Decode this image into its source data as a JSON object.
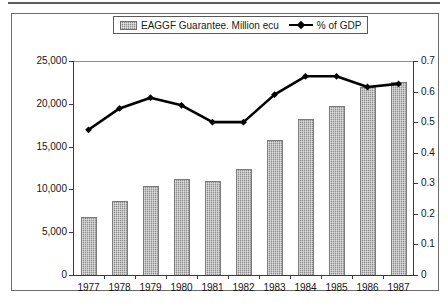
{
  "legend": {
    "entries": [
      {
        "label": "EAGGF Guarantee. Million ecu",
        "marker": "bar-swatch-icon",
        "color": "#8d8d8d"
      },
      {
        "label": "% of GDP",
        "marker": "line-marker-icon",
        "color": "#000000"
      }
    ]
  },
  "chart_data": {
    "type": "bar",
    "title": "",
    "subtitle": "",
    "xlabel": "",
    "ylabel": "",
    "grid": false,
    "legend_position": "top-center",
    "categories": [
      "1977",
      "1978",
      "1979",
      "1980",
      "1981",
      "1982",
      "1983",
      "1984",
      "1985",
      "1986",
      "1987"
    ],
    "series": [
      {
        "name": "EAGGF Guarantee. Million ecu",
        "type": "bar",
        "axis": "left",
        "color": "#8d8d8d",
        "values": [
          6800,
          8600,
          10400,
          11200,
          11000,
          12400,
          15800,
          18200,
          19700,
          22000,
          22500
        ]
      },
      {
        "name": "% of GDP",
        "type": "line",
        "axis": "right",
        "color": "#000000",
        "values": [
          0.475,
          0.545,
          0.58,
          0.555,
          0.5,
          0.5,
          0.59,
          0.65,
          0.65,
          0.615,
          0.625
        ]
      }
    ],
    "yaxis_left": {
      "ylim": [
        0,
        25000
      ],
      "ticks": [
        0,
        5000,
        10000,
        15000,
        20000,
        25000
      ],
      "tick_labels": [
        "0",
        "5,000",
        "10,000",
        "15,000",
        "20,000",
        "25,000"
      ]
    },
    "yaxis_right": {
      "ylim": [
        0,
        0.7
      ],
      "ticks": [
        0,
        0.1,
        0.2,
        0.3,
        0.4,
        0.5,
        0.6,
        0.7
      ],
      "tick_labels": [
        "0",
        "0.1",
        "0.2",
        "0.3",
        "0.4",
        "0.5",
        "0.6",
        "0.7"
      ]
    }
  }
}
